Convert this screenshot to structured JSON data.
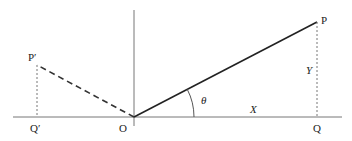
{
  "diagram": {
    "type": "coordinate-geometry-reflection",
    "labels": {
      "origin": "O",
      "point_p": "P",
      "point_q": "Q",
      "point_p_prime": "P′",
      "point_q_prime": "Q′",
      "angle": "θ",
      "x_length": "X",
      "y_length": "Y"
    },
    "colors": {
      "axis": "#777777",
      "solid_segment": "#222222",
      "dashed_segment": "#333333",
      "dotted_segment": "#777777",
      "text": "#222222"
    }
  }
}
